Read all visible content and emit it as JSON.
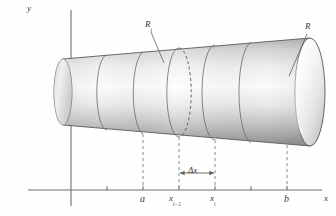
{
  "figure": {
    "background_color": "#fefefe",
    "axis_color": "#6b6b6b",
    "dash_color": "#8a8a8a",
    "outline_color": "#555555",
    "solid_fill_light": "#f2f2f2",
    "solid_fill_mid": "#c9c9c9",
    "solid_fill_dark": "#9a9a9a"
  },
  "axes": {
    "y_label": "y",
    "x_label": "x",
    "origin_x": 71,
    "origin_y": 190,
    "x_axis_start": 28,
    "x_axis_end": 322,
    "y_axis_top": 10,
    "y_axis_bottom": 206,
    "tick_positions": [
      107,
      143,
      179,
      215,
      251,
      287
    ],
    "tick_half_height": 4
  },
  "labels": {
    "a": "a",
    "b": "b",
    "x_i_minus_1_main": "x",
    "x_i_minus_1_sub": "i−1",
    "x_i_main": "x",
    "x_i_sub": "i",
    "delta_x": "Δx",
    "R_i_main": "R",
    "R_i_sub": "i",
    "R": "R",
    "y": "y",
    "x": "x"
  },
  "markers": {
    "a_x": 143,
    "x_i_minus_1_x": 179,
    "x_i_x": 215,
    "b_x": 287,
    "label_baseline_y": 203
  },
  "delta_x_bracket": {
    "left": 179,
    "right": 215,
    "y": 173,
    "label": "Δx"
  },
  "solid": {
    "left_x": 63,
    "right_x": 310,
    "left_radius_y": 33,
    "right_radius_y": 54,
    "center_y": 92,
    "ellipse_rx_left": 9,
    "ellipse_rx_right": 15,
    "shell_boundaries": [
      63,
      107,
      143,
      179,
      215,
      251,
      287,
      310
    ],
    "dashed_shell_x": 179,
    "num_shells": 6
  },
  "leaders": [
    {
      "name": "R-sub-i-leader",
      "from_x": 151,
      "from_y": 30,
      "to_x": 163,
      "to_y": 62
    },
    {
      "name": "R-leader",
      "from_x": 308,
      "from_y": 32,
      "to_x": 288,
      "to_y": 74
    }
  ]
}
